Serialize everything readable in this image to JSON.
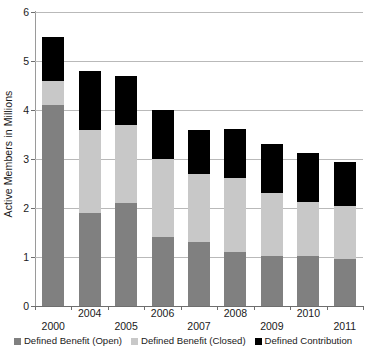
{
  "chart_data": {
    "type": "bar",
    "stacked": true,
    "title": "",
    "subtitle": "",
    "xlabel": "",
    "ylabel": "Active Members in Millions",
    "categories": [
      "2000",
      "2004",
      "2005",
      "2006",
      "2007",
      "2008",
      "2009",
      "2010",
      "2011"
    ],
    "series": [
      {
        "name": "Defined Benefit (Open)",
        "color": "#808080",
        "values": [
          4.1,
          1.9,
          2.1,
          1.4,
          1.3,
          1.1,
          1.02,
          1.03,
          0.95
        ]
      },
      {
        "name": "Defined Benefit (Closed)",
        "color": "#c8c8c8",
        "values": [
          0.5,
          1.7,
          1.6,
          1.6,
          1.4,
          1.52,
          1.28,
          1.1,
          1.1
        ]
      },
      {
        "name": "Defined Contribution",
        "color": "#000000",
        "values": [
          0.9,
          1.2,
          1.0,
          1.0,
          0.9,
          1.0,
          1.0,
          0.99,
          0.88
        ]
      }
    ],
    "totals": [
      5.5,
      4.8,
      4.7,
      4.0,
      3.6,
      3.62,
      3.3,
      3.12,
      2.93
    ],
    "ylim": [
      0,
      6
    ],
    "yticks": [
      0,
      1,
      2,
      3,
      4,
      5,
      6
    ],
    "ytick_labels": [
      "0",
      "1",
      "2",
      "3",
      "4",
      "5",
      "6"
    ],
    "grid": true,
    "grid_axis": "y",
    "legend_position": "bottom",
    "xtick_stagger": true
  },
  "legend": {
    "items": [
      {
        "label": "Defined Benefit (Open)",
        "color": "#808080"
      },
      {
        "label": "Defined Benefit (Closed)",
        "color": "#c8c8c8"
      },
      {
        "label": "Defined Contribution",
        "color": "#000000"
      }
    ]
  }
}
